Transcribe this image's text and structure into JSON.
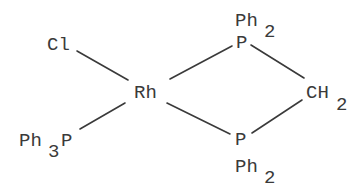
{
  "diagram": {
    "type": "chemical-structure",
    "title": "",
    "atoms": {
      "rh": {
        "label": "Rh"
      },
      "cl": {
        "label": "Cl"
      },
      "ph3p": {
        "main": "Ph",
        "sub": "3",
        "tail": "P"
      },
      "p_top": {
        "label": "P"
      },
      "p_top_ph": {
        "main": "Ph",
        "sub": "2"
      },
      "p_bottom": {
        "label": "P"
      },
      "p_bottom_ph": {
        "main": "Ph",
        "sub": "2"
      },
      "ch2": {
        "main": "CH",
        "sub": "2"
      }
    },
    "bonds": [
      {
        "from": "Cl",
        "to": "Rh"
      },
      {
        "from": "Rh",
        "to": "P (top)"
      },
      {
        "from": "Rh",
        "to": "PPh3"
      },
      {
        "from": "Rh",
        "to": "P (bottom)"
      },
      {
        "from": "P (top)",
        "to": "CH2"
      },
      {
        "from": "CH2",
        "to": "P (bottom)"
      }
    ],
    "colors": {
      "ink": "#3a3a3a",
      "background": "#ffffff"
    }
  }
}
